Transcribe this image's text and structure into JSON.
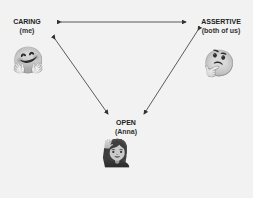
{
  "nodes": {
    "caring": {
      "label": "CARING",
      "sub": "(me)",
      "emoji": "🤗",
      "emoji_name": "hugging-face"
    },
    "assertive": {
      "label": "ASSERTIVE",
      "sub": "(both of us)",
      "emoji": "🤔",
      "emoji_name": "thinking-face"
    },
    "open": {
      "label": "OPEN",
      "sub": "(Anna)",
      "emoji": "🙋‍♀️",
      "emoji_name": "woman-raising-hand"
    }
  },
  "edges": [
    {
      "from": "caring",
      "to": "assertive",
      "bidirectional": true
    },
    {
      "from": "caring",
      "to": "open",
      "bidirectional": true
    },
    {
      "from": "assertive",
      "to": "open",
      "bidirectional": true
    }
  ],
  "colors": {
    "background": "#f2f2f2",
    "stroke": "#333333"
  }
}
